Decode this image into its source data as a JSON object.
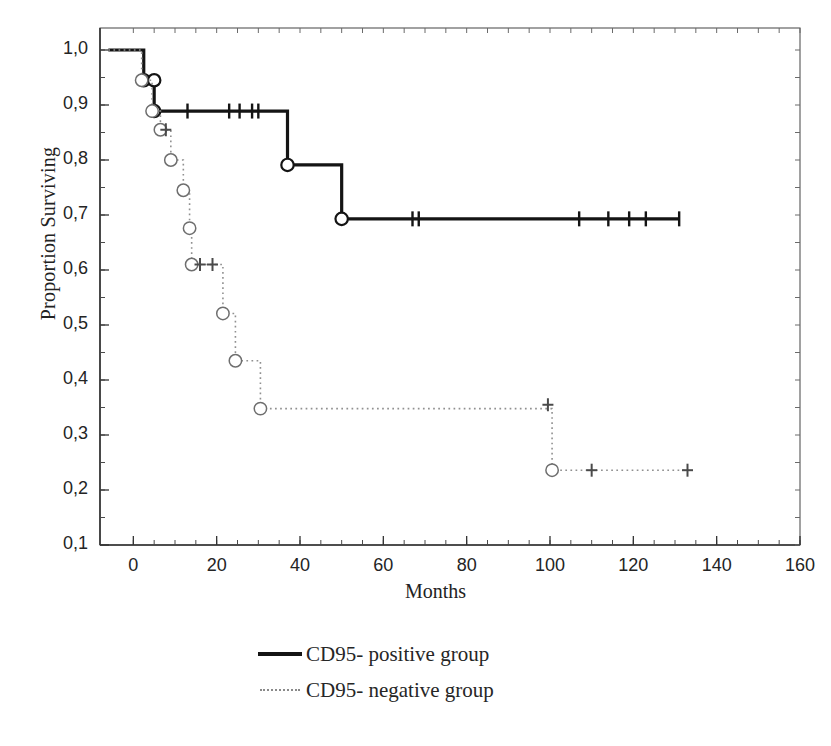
{
  "chart_data": {
    "type": "line",
    "title": "",
    "subtitle": "",
    "xlabel": "Months",
    "ylabel": "Proportion Surviving",
    "xlim": [
      -8,
      160
    ],
    "ylim": [
      0.1,
      1.04
    ],
    "xticks": [
      0,
      20,
      40,
      60,
      80,
      100,
      120,
      140,
      160
    ],
    "xtick_labels": [
      "0",
      "20",
      "40",
      "60",
      "80",
      "100",
      "120",
      "140",
      "160"
    ],
    "yticks": [
      0.1,
      0.2,
      0.3,
      0.4,
      0.5,
      0.6,
      0.7,
      0.8,
      0.9,
      1.0
    ],
    "ytick_labels": [
      "0,1",
      "0,2",
      "0,3",
      "0,4",
      "0,5",
      "0,6",
      "0,7",
      "0,8",
      "0,9",
      "1,0"
    ],
    "x_minor_tick_step": 5,
    "y_minor_tick_step": 0.05,
    "grid": false,
    "legend_position": "below-center",
    "plot_style": "kaplan-meier step survival curves, grayscale scanned figure",
    "series": [
      {
        "name": "CD95- positive group",
        "line_style": "solid",
        "color": "#141414",
        "line_width": 3.2,
        "marker": "open-circle",
        "step_points": [
          {
            "x": -6,
            "y": 1.0
          },
          {
            "x": 2.5,
            "y": 1.0
          },
          {
            "x": 2.5,
            "y": 0.945
          },
          {
            "x": 5.0,
            "y": 0.945
          },
          {
            "x": 5.0,
            "y": 0.889
          },
          {
            "x": 37.0,
            "y": 0.889
          },
          {
            "x": 37.0,
            "y": 0.791
          },
          {
            "x": 50.0,
            "y": 0.791
          },
          {
            "x": 50.0,
            "y": 0.693
          },
          {
            "x": 131.0,
            "y": 0.693
          }
        ],
        "event_markers": [
          {
            "x": 2.5,
            "y": 0.945
          },
          {
            "x": 5.0,
            "y": 0.945
          },
          {
            "x": 5.0,
            "y": 0.889
          },
          {
            "x": 37.0,
            "y": 0.791
          },
          {
            "x": 50.0,
            "y": 0.693
          }
        ],
        "censor_marks": [
          {
            "x": 13.0,
            "y": 0.889
          },
          {
            "x": 23.0,
            "y": 0.889
          },
          {
            "x": 25.5,
            "y": 0.889
          },
          {
            "x": 28.5,
            "y": 0.889
          },
          {
            "x": 30.0,
            "y": 0.889
          },
          {
            "x": 67.0,
            "y": 0.693
          },
          {
            "x": 68.5,
            "y": 0.693
          },
          {
            "x": 107.0,
            "y": 0.693
          },
          {
            "x": 114.0,
            "y": 0.693
          },
          {
            "x": 119.0,
            "y": 0.693
          },
          {
            "x": 123.0,
            "y": 0.693
          },
          {
            "x": 131.0,
            "y": 0.693
          }
        ]
      },
      {
        "name": "CD95- negative group",
        "line_style": "dotted",
        "color": "#909090",
        "line_width": 1.6,
        "marker": "open-circle",
        "step_points": [
          {
            "x": -6,
            "y": 1.0
          },
          {
            "x": 2.0,
            "y": 1.0
          },
          {
            "x": 2.0,
            "y": 0.945
          },
          {
            "x": 4.5,
            "y": 0.945
          },
          {
            "x": 4.5,
            "y": 0.889
          },
          {
            "x": 6.5,
            "y": 0.889
          },
          {
            "x": 6.5,
            "y": 0.855
          },
          {
            "x": 9.0,
            "y": 0.855
          },
          {
            "x": 9.0,
            "y": 0.8
          },
          {
            "x": 12.0,
            "y": 0.8
          },
          {
            "x": 12.0,
            "y": 0.745
          },
          {
            "x": 13.5,
            "y": 0.745
          },
          {
            "x": 13.5,
            "y": 0.676
          },
          {
            "x": 14.0,
            "y": 0.676
          },
          {
            "x": 14.0,
            "y": 0.61
          },
          {
            "x": 21.5,
            "y": 0.61
          },
          {
            "x": 21.5,
            "y": 0.521
          },
          {
            "x": 24.5,
            "y": 0.521
          },
          {
            "x": 24.5,
            "y": 0.435
          },
          {
            "x": 30.5,
            "y": 0.435
          },
          {
            "x": 30.5,
            "y": 0.348
          },
          {
            "x": 100.5,
            "y": 0.348
          },
          {
            "x": 100.5,
            "y": 0.236
          },
          {
            "x": 133.0,
            "y": 0.236
          }
        ],
        "event_markers": [
          {
            "x": 2.0,
            "y": 0.945
          },
          {
            "x": 4.5,
            "y": 0.889
          },
          {
            "x": 6.5,
            "y": 0.855
          },
          {
            "x": 9.0,
            "y": 0.8
          },
          {
            "x": 12.0,
            "y": 0.745
          },
          {
            "x": 13.5,
            "y": 0.676
          },
          {
            "x": 14.0,
            "y": 0.61
          },
          {
            "x": 21.5,
            "y": 0.521
          },
          {
            "x": 24.5,
            "y": 0.435
          },
          {
            "x": 30.5,
            "y": 0.348
          },
          {
            "x": 100.5,
            "y": 0.236
          }
        ],
        "censor_marks": [
          {
            "x": 7.8,
            "y": 0.855
          },
          {
            "x": 16.0,
            "y": 0.61
          },
          {
            "x": 19.0,
            "y": 0.61
          },
          {
            "x": 99.5,
            "y": 0.355
          },
          {
            "x": 110.0,
            "y": 0.236
          },
          {
            "x": 133.0,
            "y": 0.236
          }
        ]
      }
    ]
  },
  "legend": {
    "items": [
      {
        "label": "CD95- positive group",
        "style": "solid"
      },
      {
        "label": "CD95- negative group",
        "style": "dotted"
      }
    ]
  }
}
